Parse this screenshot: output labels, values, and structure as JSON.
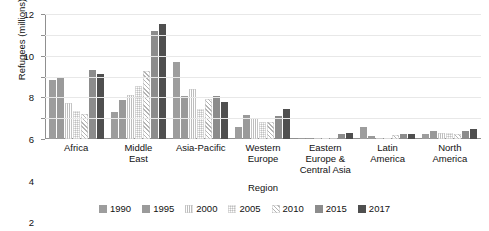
{
  "chart_data": {
    "type": "bar",
    "title": "",
    "xlabel": "Region",
    "ylabel": "Refugees (millions)",
    "ylim": [
      0,
      12
    ],
    "yticks": [
      0,
      2,
      4,
      6,
      8,
      10,
      12
    ],
    "grid": true,
    "legend_position": "bottom",
    "categories": [
      "Africa",
      "Middle\nEast",
      "Asia-Pacific",
      "Western\nEurope",
      "Eastern\nEurope &\nCentral Asia",
      "Latin\nAmerica",
      "North\nAmerica"
    ],
    "series": [
      {
        "name": "1990",
        "values": [
          5.7,
          2.55,
          7.4,
          1.2,
          0.05,
          1.2,
          0.5
        ]
      },
      {
        "name": "1995",
        "values": [
          5.9,
          3.75,
          4.15,
          2.3,
          0.08,
          0.25,
          0.75
        ]
      },
      {
        "name": "2000",
        "values": [
          3.5,
          4.25,
          4.8,
          2.05,
          0.1,
          0.1,
          0.6
        ]
      },
      {
        "name": "2005",
        "values": [
          2.7,
          5.1,
          2.9,
          1.65,
          0.1,
          0.1,
          0.55
        ]
      },
      {
        "name": "2010",
        "values": [
          2.4,
          6.55,
          3.8,
          1.6,
          0.12,
          0.35,
          0.5
        ]
      },
      {
        "name": "2015",
        "values": [
          6.6,
          10.4,
          4.1,
          2.2,
          0.5,
          0.5,
          0.75
        ]
      },
      {
        "name": "2017",
        "values": [
          6.2,
          11.0,
          3.6,
          2.9,
          0.55,
          0.5,
          1.0
        ]
      }
    ],
    "series_colors": [
      "#9d9d9d",
      "#9a9a9a",
      "#bdbdbd",
      "#dddddd",
      "#b4b4b4",
      "#8c8c8c",
      "#4f4f4f"
    ]
  }
}
